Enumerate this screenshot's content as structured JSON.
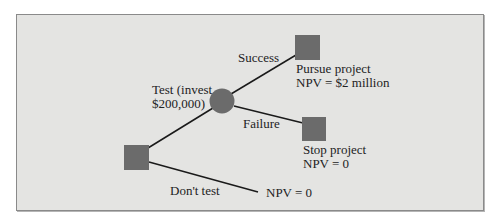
{
  "diagram": {
    "type": "decision-tree",
    "colors": {
      "background": "#e4e4e2",
      "node": "#6b6b6b",
      "line": "#1a1a1a",
      "border": "#8a8a8a"
    },
    "nodes": {
      "decision_root": {
        "shape": "square"
      },
      "chance_test": {
        "shape": "circle"
      },
      "pursue": {
        "shape": "square",
        "label_line1": "Pursue project",
        "label_line2": "NPV = $2 million"
      },
      "stop": {
        "shape": "square",
        "label_line1": "Stop project",
        "label_line2": "NPV = 0"
      },
      "no_test_outcome": {
        "label": "NPV = 0"
      }
    },
    "branches": {
      "test": {
        "label_line1": "Test (invest",
        "label_line2": "$200,000)"
      },
      "success": {
        "label": "Success"
      },
      "failure": {
        "label": "Failure"
      },
      "dont_test": {
        "label": "Don't test"
      }
    }
  }
}
